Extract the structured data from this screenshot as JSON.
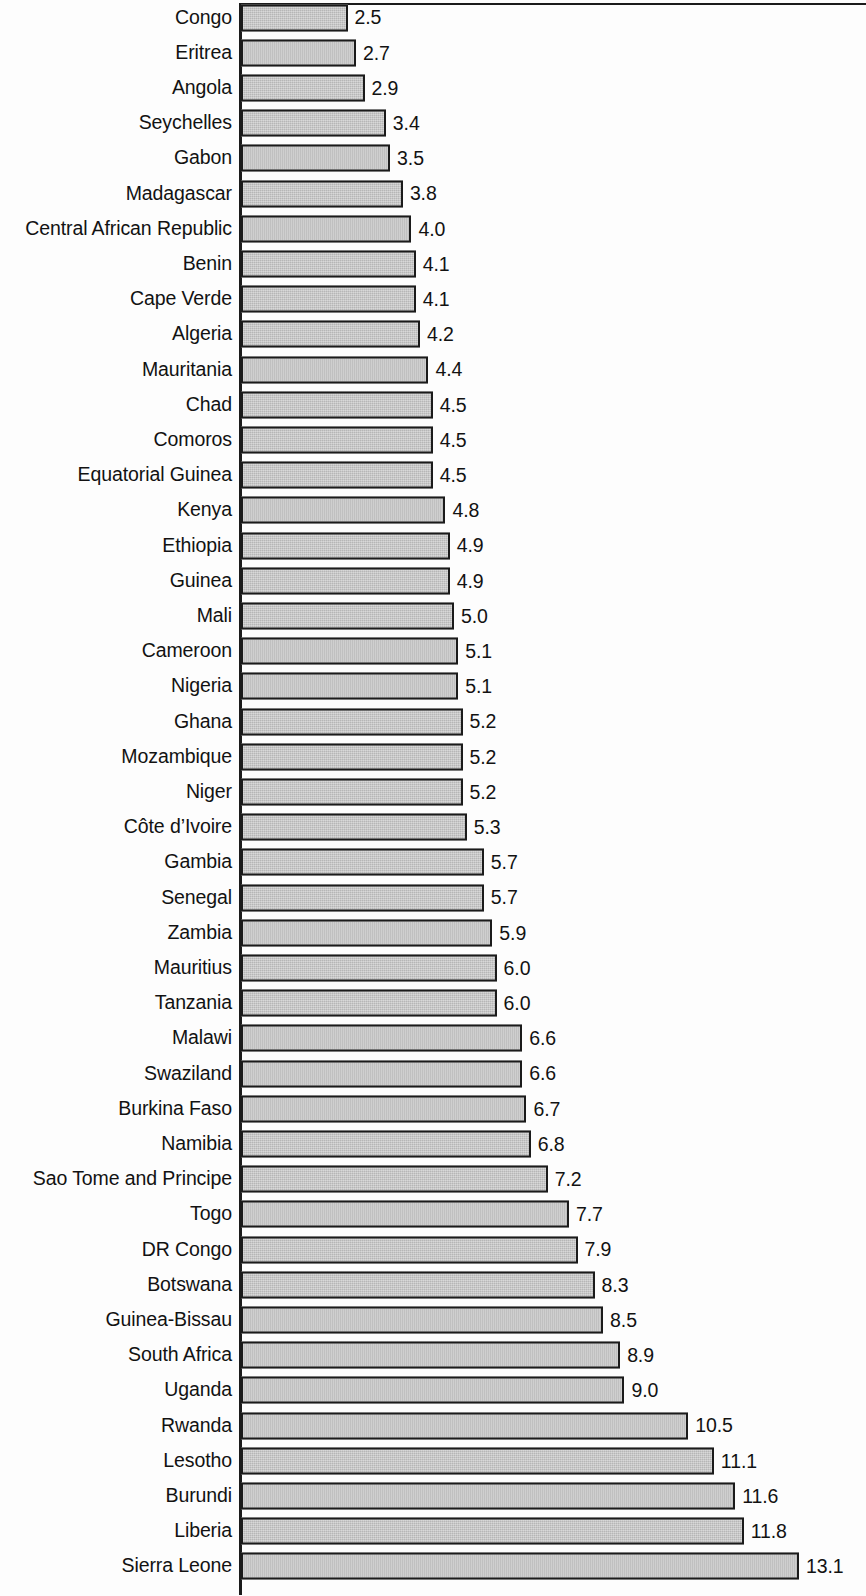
{
  "chart_data": {
    "type": "bar",
    "orientation": "horizontal",
    "title": "",
    "subtitle": "",
    "xlabel": "",
    "ylabel": "",
    "xlim": [
      0,
      13.1
    ],
    "grid": false,
    "legend": null,
    "value_labels_shown": true,
    "value_label_format": "one-decimal",
    "sorted": "ascending",
    "bar_fill_color": "#c2c2c2",
    "bar_border_color": "#1b1b1b",
    "axis_color": "#1b1b1b",
    "text_color": "#121212",
    "background_color": "#ffffff",
    "categories": [
      "Congo",
      "Eritrea",
      "Angola",
      "Seychelles",
      "Gabon",
      "Madagascar",
      "Central African Republic",
      "Benin",
      "Cape Verde",
      "Algeria",
      "Mauritania",
      "Chad",
      "Comoros",
      "Equatorial Guinea",
      "Kenya",
      "Ethiopia",
      "Guinea",
      "Mali",
      "Cameroon",
      "Nigeria",
      "Ghana",
      "Mozambique",
      "Niger",
      "Côte d’Ivoire",
      "Gambia",
      "Senegal",
      "Zambia",
      "Mauritius",
      "Tanzania",
      "Malawi",
      "Swaziland",
      "Burkina Faso",
      "Namibia",
      "Sao Tome and Principe",
      "Togo",
      "DR Congo",
      "Botswana",
      "Guinea-Bissau",
      "South Africa",
      "Uganda",
      "Rwanda",
      "Lesotho",
      "Burundi",
      "Liberia",
      "Sierra Leone"
    ],
    "values": [
      2.5,
      2.7,
      2.9,
      3.4,
      3.5,
      3.8,
      4.0,
      4.1,
      4.1,
      4.2,
      4.4,
      4.5,
      4.5,
      4.5,
      4.8,
      4.9,
      4.9,
      5.0,
      5.1,
      5.1,
      5.2,
      5.2,
      5.2,
      5.3,
      5.7,
      5.7,
      5.9,
      6.0,
      6.0,
      6.6,
      6.6,
      6.7,
      6.8,
      7.2,
      7.7,
      7.9,
      8.3,
      8.5,
      8.9,
      9.0,
      10.5,
      11.1,
      11.6,
      11.8,
      13.1
    ],
    "value_labels": [
      "2.5",
      "2.7",
      "2.9",
      "3.4",
      "3.5",
      "3.8",
      "4.0",
      "4.1",
      "4.1",
      "4.2",
      "4.4",
      "4.5",
      "4.5",
      "4.5",
      "4.8",
      "4.9",
      "4.9",
      "5.0",
      "5.1",
      "5.1",
      "5.2",
      "5.2",
      "5.2",
      "5.3",
      "5.7",
      "5.7",
      "5.9",
      "6.0",
      "6.0",
      "6.6",
      "6.6",
      "6.7",
      "6.8",
      "7.2",
      "7.7",
      "7.9",
      "8.3",
      "8.5",
      "8.9",
      "9.0",
      "10.5",
      "11.1",
      "11.6",
      "11.8",
      "13.1"
    ]
  }
}
